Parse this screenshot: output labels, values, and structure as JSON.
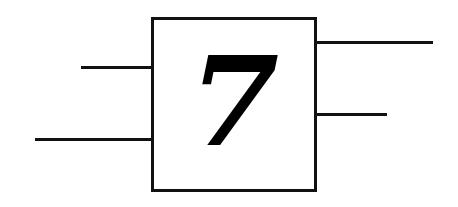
{
  "diagram": {
    "block": {
      "label": "7"
    },
    "inputs": [
      {
        "name": "input-top",
        "x1": 81,
        "x2": 152,
        "y": 66
      },
      {
        "name": "input-bottom",
        "x1": 35,
        "x2": 152,
        "y": 138
      }
    ],
    "outputs": [
      {
        "name": "output-top",
        "x1": 312,
        "x2": 433,
        "y": 41
      },
      {
        "name": "output-bottom",
        "x1": 312,
        "x2": 387,
        "y": 113
      }
    ],
    "colors": {
      "stroke": "#111111",
      "background": "#ffffff"
    }
  }
}
